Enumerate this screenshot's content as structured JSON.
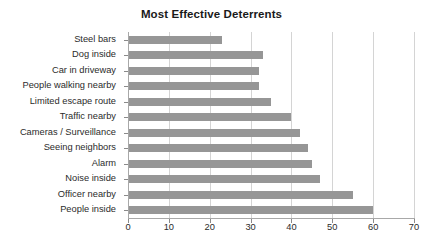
{
  "chart_data": {
    "type": "bar",
    "orientation": "horizontal",
    "title": "Most Effective Deterrents",
    "xlabel": "",
    "ylabel": "",
    "xlim": [
      0,
      70
    ],
    "xticks": [
      0,
      10,
      20,
      30,
      40,
      50,
      60,
      70
    ],
    "grid": "vertical",
    "legend": "none",
    "bar_color": "#969696",
    "categories": [
      "Steel bars",
      "Dog inside",
      "Car in driveway",
      "People walking nearby",
      "Limited escape route",
      "Traffic nearby",
      "Cameras / Surveillance",
      "Seeing neighbors",
      "Alarm",
      "Noise inside",
      "Officer nearby",
      "People inside"
    ],
    "values": [
      23,
      33,
      32,
      32,
      35,
      40,
      42,
      44,
      45,
      47,
      55,
      60
    ]
  }
}
